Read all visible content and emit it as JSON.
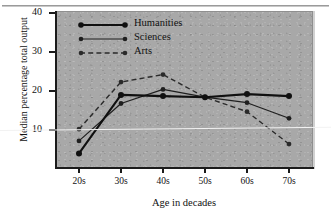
{
  "chart_data": {
    "type": "line",
    "title": "",
    "xlabel": "Age in decades",
    "ylabel": "Median percentage total output",
    "categories": [
      "20s",
      "30s",
      "40s",
      "50s",
      "60s",
      "70s"
    ],
    "xticklabels": [
      "20s",
      "30s",
      "40s",
      "50s",
      "60s",
      "70s"
    ],
    "yticklabels": [
      "10",
      "20",
      "30",
      "40"
    ],
    "yticks": [
      10,
      20,
      30,
      40
    ],
    "ylim": [
      0,
      40
    ],
    "grid": false,
    "legend_position": "top-left",
    "series": [
      {
        "name": "Humanities",
        "style": "solid-thick",
        "marker": "circle-large",
        "values": [
          4.0,
          19.0,
          18.7,
          18.4,
          19.2,
          18.7
        ]
      },
      {
        "name": "Sciences",
        "style": "solid-thin",
        "marker": "circle-small",
        "values": [
          7.2,
          16.8,
          20.4,
          18.4,
          17.0,
          13.0
        ]
      },
      {
        "name": "Arts",
        "style": "dashed",
        "marker": "circle-small",
        "values": [
          10.2,
          22.3,
          24.2,
          18.4,
          14.7,
          6.4
        ]
      }
    ],
    "colors": {
      "panel_background": "#a8a8a8",
      "figure_background": "#ffffff",
      "axis": "#1b1b1b",
      "humanities": "#101010",
      "sciences": "#1f1f1f",
      "arts": "#2a2a2a",
      "fold_line": "#f2f2f2"
    }
  }
}
